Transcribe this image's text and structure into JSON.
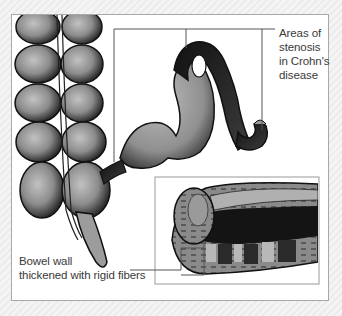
{
  "figure": {
    "labels": {
      "stenosis": [
        "Areas of",
        "stenosis",
        "in Crohn's",
        "disease"
      ],
      "bowel_wall": [
        "Bowel wall",
        "thickened with rigid fibers"
      ]
    },
    "colors": {
      "background": "#f0f0f0",
      "frame_border": "#a8a8a8",
      "tissue_fill": "#9a9a9a",
      "tissue_shadow": "#1e1e1e",
      "leader_line": "#555555",
      "text": "#3a3a3a"
    }
  }
}
